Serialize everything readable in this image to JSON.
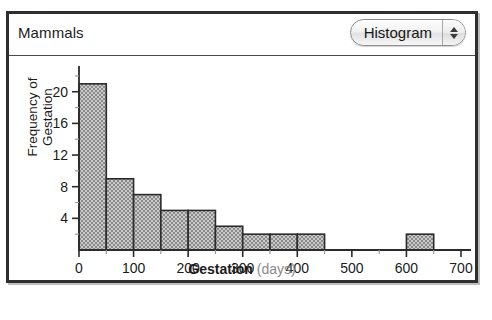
{
  "window": {
    "title": "Mammals"
  },
  "toolbar": {
    "plot_type_label": "Histogram",
    "stepper_up_icon": "triangle-up-icon",
    "stepper_down_icon": "triangle-down-icon"
  },
  "chart_data": {
    "type": "bar",
    "title": "Mammals",
    "xlabel_strong": "Gestation",
    "xlabel_muted": "(days)",
    "ylabel": "Frequency of\nGestation",
    "xlim": [
      0,
      700
    ],
    "ylim": [
      0,
      23
    ],
    "bin_width": 50,
    "grid": false,
    "legend": null,
    "xticks": [
      0,
      100,
      200,
      300,
      400,
      500,
      600,
      700
    ],
    "xtick_labels": [
      "0",
      "100",
      "200",
      "300",
      "400",
      "500",
      "600",
      "700"
    ],
    "xminor_step": 50,
    "yticks": [
      4,
      8,
      12,
      16,
      20
    ],
    "ytick_labels": [
      "4",
      "8",
      "12",
      "16",
      "20"
    ],
    "yminor_step": 2,
    "bar_fill": "#9e9e9e",
    "bar_edge": "#2b2b2b",
    "bins": [
      {
        "x0": 0,
        "x1": 50,
        "count": 21
      },
      {
        "x0": 50,
        "x1": 100,
        "count": 9
      },
      {
        "x0": 100,
        "x1": 150,
        "count": 7
      },
      {
        "x0": 150,
        "x1": 200,
        "count": 5
      },
      {
        "x0": 200,
        "x1": 250,
        "count": 5
      },
      {
        "x0": 250,
        "x1": 300,
        "count": 3
      },
      {
        "x0": 300,
        "x1": 350,
        "count": 2
      },
      {
        "x0": 350,
        "x1": 400,
        "count": 2
      },
      {
        "x0": 400,
        "x1": 450,
        "count": 2
      },
      {
        "x0": 450,
        "x1": 500,
        "count": 0
      },
      {
        "x0": 500,
        "x1": 550,
        "count": 0
      },
      {
        "x0": 550,
        "x1": 600,
        "count": 0
      },
      {
        "x0": 600,
        "x1": 650,
        "count": 2
      },
      {
        "x0": 650,
        "x1": 700,
        "count": 0
      }
    ]
  }
}
